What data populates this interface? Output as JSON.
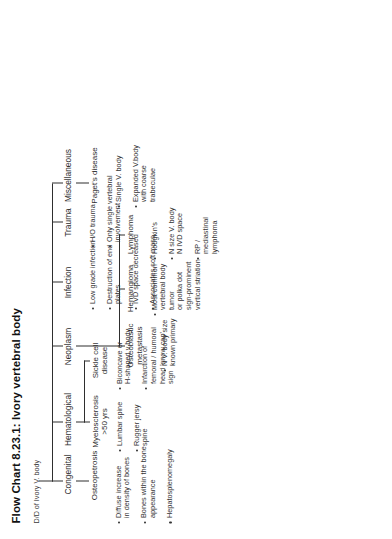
{
  "figure": {
    "title": "Flow Chart 8.23.1: Ivory vertebral body",
    "root": "D/D of Ivory V. body"
  },
  "branches": [
    {
      "id": "congenital",
      "label": "Congenital",
      "child": "Osteopetrosis",
      "bullets": [
        "Diffuse increase\nin density of bones",
        "Bones within the bone\nappearance",
        "Hepatosplenomegaly"
      ]
    },
    {
      "id": "hematological",
      "label": "Hematological",
      "child": "Myelosclerosis >50 yrs",
      "bullets": [
        "Lumbar spine",
        "Rugger jersy spine"
      ],
      "child2": "Sickle cell disease",
      "bullets2": [
        "Biconcave or\nH-shaped v body",
        "Infarction of\nfemoral / humoral\nhead 'snow cap' sign"
      ]
    },
    {
      "id": "neoplasm",
      "label": "Neoplasm",
      "child": "Osteoblastic\nmetastasis",
      "bullets": [
        "N V. body size\nknown primary"
      ],
      "child2": "Hemangioma",
      "bullets2": [
        "Most common\nvertebral body\ntumor\nor polka dot\nsign-prominent\nvertical striation"
      ],
      "child3": "Lymphoma",
      "bullets3": [
        "Hodgkin's",
        "N size V. body\nN IVD space",
        "RP / mediastinal\nlymphoma"
      ]
    },
    {
      "id": "infection",
      "label": "Infection",
      "bullets": [
        "Low grade infection",
        "Destruction of end\nplates",
        "IVD space decreased",
        "Associates soft mass"
      ]
    },
    {
      "id": "trauma",
      "label": "Trauma",
      "bullets": [
        "H/O trauma",
        "Only single vertebral\ninvolvement"
      ]
    },
    {
      "id": "miscellaneous",
      "label": "Miscellaneous",
      "child": "Paget's disease",
      "bullets": [
        "Single V. body",
        "Expanded V.body\nwith coarse\ntrabeculae"
      ]
    }
  ]
}
